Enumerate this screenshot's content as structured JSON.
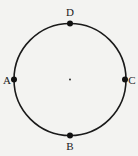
{
  "diagram": {
    "type": "circle-with-points",
    "colors": {
      "background": "#f3f3f1",
      "stroke": "#1a1a1a",
      "point": "#111111"
    },
    "circle": {
      "cx": 70,
      "cy": 79.5,
      "r": 56
    },
    "center_dot": {
      "x": 70,
      "y": 79.5
    },
    "points": [
      {
        "id": "D",
        "label": "D",
        "x": 70,
        "y": 23.5,
        "label_x": 70,
        "label_y": 16,
        "anchor": "middle"
      },
      {
        "id": "A",
        "label": "A",
        "x": 14,
        "y": 79.5,
        "label_x": 7,
        "label_y": 83.5,
        "anchor": "middle"
      },
      {
        "id": "C",
        "label": "C",
        "x": 125,
        "y": 79.5,
        "label_x": 132,
        "label_y": 83.5,
        "anchor": "middle"
      },
      {
        "id": "B",
        "label": "B",
        "x": 70,
        "y": 135.5,
        "label_x": 70,
        "label_y": 150,
        "anchor": "middle"
      }
    ]
  }
}
